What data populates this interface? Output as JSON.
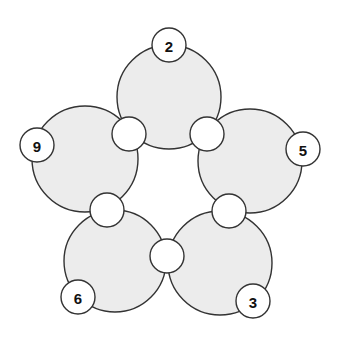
{
  "diagram": {
    "type": "five-circle-ring-puzzle",
    "colors": {
      "circle_fill": "#ececec",
      "stroke": "#333333",
      "node_fill": "#ffffff"
    },
    "circles": [
      {
        "id": "top",
        "label": "2",
        "cx": 169,
        "cy": 97,
        "r": 52,
        "lx": 169,
        "ly": 45
      },
      {
        "id": "right",
        "label": "5",
        "cx": 250,
        "cy": 161,
        "r": 52,
        "lx": 303,
        "ly": 149
      },
      {
        "id": "bottom-right",
        "label": "3",
        "cx": 220,
        "cy": 263,
        "r": 52,
        "lx": 253,
        "ly": 301
      },
      {
        "id": "bottom-left",
        "label": "6",
        "cx": 115,
        "cy": 261,
        "r": 51,
        "lx": 78,
        "ly": 297
      },
      {
        "id": "left",
        "label": "9",
        "cx": 85,
        "cy": 159,
        "r": 53,
        "lx": 37,
        "ly": 145
      }
    ],
    "intersections": [
      {
        "id": "top-right",
        "cx": 207,
        "cy": 134,
        "value": ""
      },
      {
        "id": "right-bottom",
        "cx": 229,
        "cy": 211,
        "value": ""
      },
      {
        "id": "bottom",
        "cx": 167,
        "cy": 256,
        "value": ""
      },
      {
        "id": "left-bottom",
        "cx": 107,
        "cy": 210,
        "value": ""
      },
      {
        "id": "top-left",
        "cx": 129,
        "cy": 134,
        "value": ""
      }
    ]
  }
}
